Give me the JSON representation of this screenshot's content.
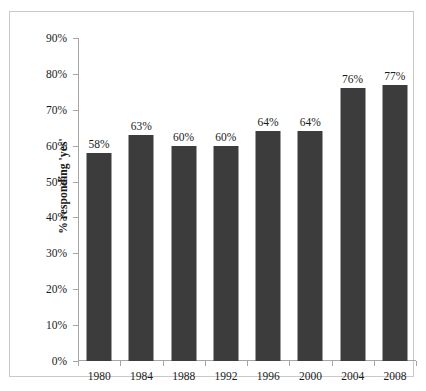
{
  "chart_data": {
    "type": "bar",
    "title": "",
    "xlabel": "",
    "ylabel": "% responding 'yes'",
    "categories": [
      "1980",
      "1984",
      "1988",
      "1992",
      "1996",
      "2000",
      "2004",
      "2008"
    ],
    "values": [
      58,
      63,
      60,
      60,
      64,
      64,
      76,
      77
    ],
    "value_labels": [
      "58%",
      "63%",
      "60%",
      "60%",
      "64%",
      "64%",
      "76%",
      "77%"
    ],
    "ylim": [
      0,
      90
    ],
    "ytick_values": [
      0,
      10,
      20,
      30,
      40,
      50,
      60,
      70,
      80,
      90
    ],
    "ytick_labels": [
      "0%",
      "10%",
      "20%",
      "30%",
      "40%",
      "50%",
      "60%",
      "70%",
      "80%",
      "90%"
    ],
    "grid": false,
    "legend": null,
    "legend_position": "none",
    "series": [
      {
        "name": "% responding 'yes'",
        "values": [
          58,
          63,
          60,
          60,
          64,
          64,
          76,
          77
        ],
        "color": "#3c3c3c"
      }
    ]
  },
  "colors": {
    "bar": "#3c3c3c",
    "axis": "#a6a6a6",
    "frame": "#c9c9c9",
    "text": "#1b1b1b",
    "background": "#ffffff"
  }
}
